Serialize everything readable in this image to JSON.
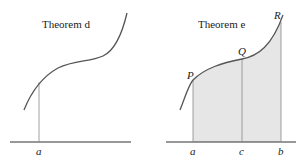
{
  "panels": [
    {
      "title": "Theorem d",
      "labels": {
        "a": "a"
      }
    },
    {
      "title": "Theorem e",
      "labels": {
        "a": "a",
        "c": "c",
        "b": "b",
        "P": "P",
        "Q": "Q",
        "R": "R"
      }
    }
  ],
  "colors": {
    "curve": "#555555",
    "axis": "#333333",
    "vertical": "#888888",
    "shade": "#e6e6e6"
  }
}
